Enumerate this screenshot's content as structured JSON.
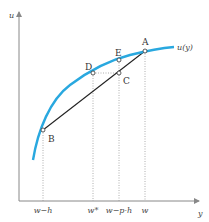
{
  "diagram": {
    "curve_label": "u(y)",
    "y_axis_label": "u",
    "x_axis_label": "y",
    "points": [
      {
        "name": "A",
        "label": "A"
      },
      {
        "name": "B",
        "label": "B"
      },
      {
        "name": "C",
        "label": "C"
      },
      {
        "name": "D",
        "label": "D"
      },
      {
        "name": "E",
        "label": "E"
      }
    ],
    "x_ticks": [
      "w−h",
      "w*",
      "w−p·h",
      "w"
    ],
    "colors": {
      "curve": "#29a8df",
      "chord": "#222222",
      "axis": "#888888",
      "guides": "#999999"
    }
  }
}
